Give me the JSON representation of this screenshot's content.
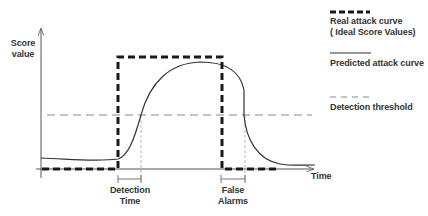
{
  "diagram": {
    "y_axis_label_line1": "Score",
    "y_axis_label_line2": "value",
    "x_axis_label": "Time",
    "annotations": {
      "detection_time_line1": "Detection",
      "detection_time_line2": "Time",
      "false_alarms_line1": "False",
      "false_alarms_line2": "Alarms"
    },
    "legend": [
      {
        "style": "thick-dashed",
        "label_line1": "Real attack curve",
        "label_line2": "( Ideal Score Values)"
      },
      {
        "style": "solid",
        "label_line1": "Predicted attack curve"
      },
      {
        "style": "thin-dashed",
        "label_line1": "Detection threshold"
      }
    ],
    "colors": {
      "real_curve": "#1a1a1a",
      "predicted_curve": "#333333",
      "threshold": "#888888",
      "axes": "#555555"
    }
  }
}
